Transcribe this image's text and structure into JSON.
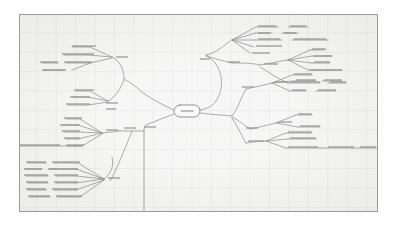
{
  "document": {
    "type": "mind-map",
    "title": "Mind map diagram",
    "legibility": "text-illegible-low-resolution",
    "canvas": {
      "background_color": "#f2f2f1",
      "border_color": "#9a9a9a",
      "grid": "on",
      "grid_color": "#96999f",
      "grid_spacing_px": 19,
      "x": 19,
      "y": 14,
      "width": 359,
      "height": 198
    },
    "paper_background_color": "#fefefe",
    "stroke_color": "#4a4a4a",
    "text_color": "#555555"
  },
  "root": {
    "label": "",
    "shape": "rounded-rectangle",
    "x": 185,
    "y": 110,
    "width": 26,
    "height": 12
  },
  "branches": [
    {
      "id": "right-upper",
      "side": "right",
      "label": "",
      "node": {
        "x": 205,
        "y": 52
      },
      "children": [
        {
          "label": "",
          "node": {
            "x": 231,
            "y": 37
          },
          "leaves": [
            "",
            "",
            "",
            "",
            ""
          ]
        },
        {
          "label": "",
          "node": {
            "x": 231,
            "y": 59
          },
          "children": [
            {
              "label": "",
              "node": {
                "x": 277,
                "y": 60
              },
              "leaves": [
                "",
                "",
                "",
                ""
              ]
            },
            {
              "label": "",
              "node": {
                "x": 250,
                "y": 76
              },
              "leaves": [
                ""
              ]
            }
          ]
        }
      ]
    },
    {
      "id": "right-lower",
      "side": "right",
      "label": "",
      "node": {
        "x": 212,
        "y": 115
      },
      "children": [
        {
          "label": "",
          "node": {
            "x": 235,
            "y": 89
          },
          "leaves": [
            "",
            "",
            ""
          ]
        },
        {
          "label": "",
          "node": {
            "x": 232,
            "y": 121
          },
          "leaves": [
            "",
            "",
            ""
          ]
        },
        {
          "label": "",
          "node": {
            "x": 244,
            "y": 136
          },
          "leaves": [
            "",
            "",
            ""
          ],
          "long_connector": true
        }
      ]
    },
    {
      "id": "left-upper",
      "side": "left",
      "label": "",
      "node": {
        "x": 140,
        "y": 88
      },
      "children": [
        {
          "label": "",
          "node": {
            "x": 122,
            "y": 72
          },
          "leaves": [
            "",
            "",
            ""
          ]
        },
        {
          "label": "",
          "node": {
            "x": 118,
            "y": 98
          },
          "leaves": [
            "",
            "",
            ""
          ]
        }
      ]
    },
    {
      "id": "left-middle",
      "side": "left",
      "label": "",
      "node": {
        "x": 143,
        "y": 130
      },
      "children": [
        {
          "label": "",
          "node": {
            "x": 98,
            "y": 135
          },
          "leaves": [
            "",
            "",
            "",
            "",
            ""
          ],
          "long_connector": true
        }
      ]
    },
    {
      "id": "left-lower",
      "side": "left",
      "label": "",
      "node": {
        "x": 104,
        "y": 178
      },
      "children": [
        {
          "label": "",
          "node": {
            "x": 104,
            "y": 178
          },
          "leaves": [
            "",
            "",
            "",
            "",
            "",
            ""
          ]
        }
      ]
    },
    {
      "id": "bottom-trunk",
      "side": "down",
      "label": "",
      "node": {
        "x": 143,
        "y": 214
      },
      "leaves": []
    }
  ]
}
